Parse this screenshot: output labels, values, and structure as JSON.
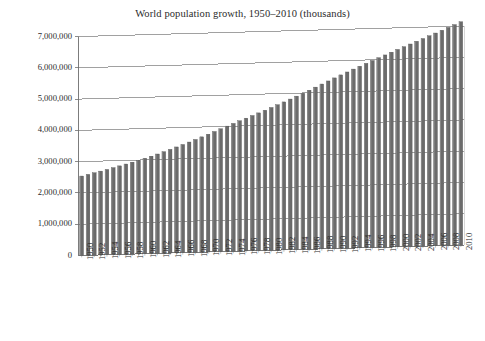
{
  "chart_data": {
    "type": "bar",
    "title": "World population growth, 1950–2010 (thousands)",
    "xlabel": "",
    "ylabel": "",
    "ylim": [
      0,
      7000000
    ],
    "ytick_labels": [
      "7,000,000",
      "6,000,000",
      "5,000,000",
      "4,000,000",
      "3,000,000",
      "2,000,000",
      "1,000,000",
      "0"
    ],
    "ytick_values": [
      7000000,
      6000000,
      5000000,
      4000000,
      3000000,
      2000000,
      1000000,
      0
    ],
    "grid": true,
    "legend": false,
    "bar_color": "#6b6b6b",
    "bar_edge_color": "#4a4a4a",
    "axis_color": "#6e6e6e",
    "text_color": "#2b2b2b",
    "background": "#ffffff",
    "xtick_step": 2,
    "categories": [
      1950,
      1951,
      1952,
      1953,
      1954,
      1955,
      1956,
      1957,
      1958,
      1959,
      1960,
      1961,
      1962,
      1963,
      1964,
      1965,
      1966,
      1967,
      1968,
      1969,
      1970,
      1971,
      1972,
      1973,
      1974,
      1975,
      1976,
      1977,
      1978,
      1979,
      1980,
      1981,
      1982,
      1983,
      1984,
      1985,
      1986,
      1987,
      1988,
      1989,
      1990,
      1991,
      1992,
      1993,
      1994,
      1995,
      1996,
      1997,
      1998,
      1999,
      2000,
      2001,
      2002,
      2003,
      2004,
      2005,
      2006,
      2007,
      2008,
      2009,
      2010
    ],
    "values": [
      2536431,
      2584034,
      2630584,
      2677609,
      2726000,
      2776401,
      2828513,
      2882045,
      2936767,
      2992842,
      3050965,
      3111312,
      3175335,
      3242906,
      3312946,
      3384162,
      3456222,
      3530262,
      3606396,
      3684459,
      3763897,
      3844477,
      3925551,
      4006465,
      4086439,
      4165522,
      4243930,
      4322118,
      4400932,
      4481053,
      4562401,
      4645034,
      4729391,
      4816010,
      4903776,
      4991930,
      5082526,
      5175384,
      5268932,
      5361467,
      5453355,
      5543425,
      5632045,
      5719048,
      5804963,
      5890376,
      5975304,
      6059735,
      6143494,
      6226340,
      6308493,
      6390054,
      6471254,
      6552582,
      6634324,
      6716691,
      6799642,
      6883142,
      6967186,
      7051694,
      7136607
    ],
    "xtick_labels": [
      "1950",
      "1952",
      "1954",
      "1956",
      "1958",
      "1960",
      "1962",
      "1964",
      "1966",
      "1968",
      "1970",
      "1972",
      "1974",
      "1976",
      "1978",
      "1980",
      "1982",
      "1984",
      "1986",
      "1988",
      "1990",
      "1992",
      "1994",
      "1996",
      "1998",
      "2000",
      "2002",
      "2004",
      "2006",
      "2008",
      "2010"
    ]
  }
}
